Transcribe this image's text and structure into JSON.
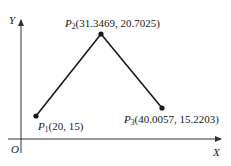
{
  "diagram": {
    "axes": {
      "x_label": "X",
      "y_label": "Y",
      "origin_label": "O"
    },
    "points": [
      {
        "name": "P",
        "sub": "1",
        "coords": "(20, 15)",
        "x": 20,
        "y": 15
      },
      {
        "name": "P",
        "sub": "2",
        "coords": "(31.3469, 20.7025)",
        "x": 31.3469,
        "y": 20.7025
      },
      {
        "name": "P",
        "sub": "3",
        "coords": "(40.0057, 15.2203)",
        "x": 40.0057,
        "y": 15.2203
      }
    ],
    "colors": {
      "line": "#1a1a1a",
      "axis": "#333333",
      "background": "#ffffff"
    }
  }
}
